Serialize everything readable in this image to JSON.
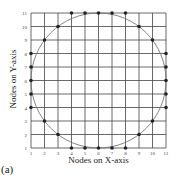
{
  "chart_data": {
    "type": "scatter",
    "title": "",
    "xlabel": "Nodes on X-axis",
    "ylabel": "Nodes on Y-axis",
    "panel_label": "(a)",
    "xlim": [
      1,
      11
    ],
    "ylim": [
      1,
      11
    ],
    "x_ticks": [
      "1",
      "2",
      "3",
      "4",
      "5",
      "6",
      "7",
      "8",
      "9",
      "10",
      "11"
    ],
    "y_ticks": [
      "1",
      "2",
      "3",
      "4",
      "5",
      "6",
      "7",
      "8",
      "9",
      "10",
      "11"
    ],
    "grid": true,
    "circle": {
      "cx": 6,
      "cy": 6,
      "r": 5
    },
    "points": [
      [
        4,
        11
      ],
      [
        5,
        11
      ],
      [
        6,
        11
      ],
      [
        7,
        11
      ],
      [
        8,
        11
      ],
      [
        3,
        10
      ],
      [
        9,
        10
      ],
      [
        2,
        9
      ],
      [
        10,
        9
      ],
      [
        1,
        8
      ],
      [
        1,
        7
      ],
      [
        1,
        6
      ],
      [
        1,
        5
      ],
      [
        1,
        4
      ],
      [
        11,
        8
      ],
      [
        11,
        7
      ],
      [
        11,
        6
      ],
      [
        11,
        5
      ],
      [
        11,
        4
      ],
      [
        2,
        3
      ],
      [
        10,
        3
      ],
      [
        3,
        2
      ],
      [
        9,
        2
      ],
      [
        4,
        1
      ],
      [
        5,
        1
      ],
      [
        6,
        1
      ],
      [
        7,
        1
      ],
      [
        8,
        1
      ]
    ]
  }
}
